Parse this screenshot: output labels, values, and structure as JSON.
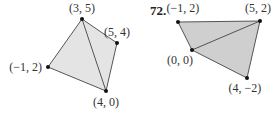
{
  "figures": [
    {
      "number": "",
      "fill": "#e4e4e4",
      "points": [
        {
          "label": "(3, 5)",
          "x": 82,
          "y": 19,
          "lx": 82,
          "ly": 12,
          "anchor": "middle"
        },
        {
          "label": "(5, 4)",
          "x": 117,
          "y": 43,
          "lx": 117,
          "ly": 36,
          "anchor": "middle"
        },
        {
          "label": "(−1, 2)",
          "x": 48,
          "y": 67,
          "lx": 42,
          "ly": 71,
          "anchor": "end"
        },
        {
          "label": "(4, 0)",
          "x": 106,
          "y": 91,
          "lx": 106,
          "ly": 106,
          "anchor": "middle"
        }
      ]
    },
    {
      "number": "72.",
      "fill": "#cfcfcf",
      "points": [
        {
          "label": "(−1, 2)",
          "x": 178,
          "y": 22,
          "lx": 183,
          "ly": 12,
          "anchor": "middle"
        },
        {
          "label": "(5, 2)",
          "x": 260,
          "y": 21,
          "lx": 258,
          "ly": 12,
          "anchor": "middle"
        },
        {
          "label": "(0, 0)",
          "x": 192,
          "y": 50,
          "lx": 180,
          "ly": 64,
          "anchor": "middle"
        },
        {
          "label": "(4, −2)",
          "x": 247,
          "y": 78,
          "lx": 245,
          "ly": 92,
          "anchor": "middle"
        }
      ]
    }
  ]
}
